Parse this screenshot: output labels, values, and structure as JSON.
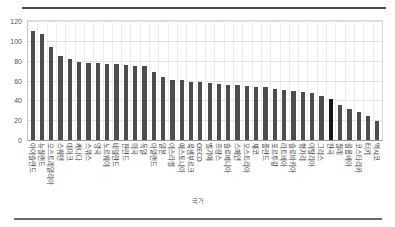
{
  "chart_data": {
    "type": "bar",
    "title": "",
    "subtitle": "",
    "xlabel": "",
    "ylabel": "",
    "ylim": [
      0,
      120
    ],
    "yticks": [
      0,
      20,
      40,
      60,
      80,
      100,
      120
    ],
    "grid": true,
    "legend": null,
    "highlight_category": "한국",
    "highlight_color": "#161616",
    "bar_color": "#4d4d4d",
    "categories": [
      "아이슬란드",
      "뉴질랜드",
      "오스트레일리아",
      "스웨덴",
      "데마크",
      "캐나다",
      "스위스",
      "영국",
      "노르웨이",
      "네덜란드",
      "핀란드",
      "미국",
      "독일",
      "아일랜드",
      "일본",
      "이스라엘",
      "에스토니아",
      "룩셈부르크",
      "OECD",
      "벨기에",
      "프랑스",
      "슬로베니아",
      "스페인",
      "오스트리아",
      "체코",
      "폴란드",
      "포르투갈",
      "라트비아",
      "슬로바키아",
      "헝가리",
      "이탈리아",
      "그리스",
      "한국",
      "칠레",
      "콜롬비아",
      "코스타리카",
      "터키",
      "멕시코"
    ],
    "values": [
      110,
      107,
      94,
      85,
      82,
      79,
      78,
      77.5,
      77,
      76.5,
      76,
      75,
      74.5,
      68.5,
      64,
      61,
      61,
      58.5,
      58.5,
      57,
      56,
      55.5,
      55,
      54,
      53.5,
      53,
      51,
      50,
      49.5,
      48,
      47,
      44,
      41,
      35,
      31,
      28.5,
      24,
      19
    ]
  },
  "yaxis": {
    "ticks": [
      "0",
      "20",
      "40",
      "60",
      "80",
      "100",
      "120"
    ]
  },
  "footer": {
    "note": "국가"
  }
}
